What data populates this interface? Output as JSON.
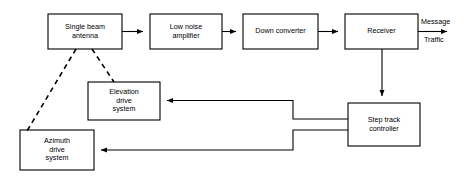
{
  "diagram": {
    "background_color": "#ffffff",
    "line_color": "#000000",
    "blocks": [
      {
        "id": "single-beam-antenna",
        "label": "Single beam\nantenna",
        "x": 48,
        "y": 14,
        "w": 74,
        "h": 35
      },
      {
        "id": "low-noise-amplifier",
        "label": "Low noise\namplifier",
        "x": 150,
        "y": 14,
        "w": 72,
        "h": 35
      },
      {
        "id": "down-converter",
        "label": "Down converter",
        "x": 243,
        "y": 14,
        "w": 75,
        "h": 35
      },
      {
        "id": "receiver",
        "label": "Receiver",
        "x": 345,
        "y": 14,
        "w": 73,
        "h": 35
      },
      {
        "id": "elevation-drive-system",
        "label": "Elevation\ndrive\nsystem",
        "x": 88,
        "y": 82,
        "w": 72,
        "h": 38
      },
      {
        "id": "azimuth-drive-system",
        "label": "Azimuth\ndrive\nsystem",
        "x": 20,
        "y": 130,
        "w": 74,
        "h": 40
      },
      {
        "id": "step-track-controller",
        "label": "Step track\ncontroller",
        "x": 348,
        "y": 103,
        "w": 72,
        "h": 43
      }
    ],
    "edge_labels": [
      {
        "id": "message-label",
        "text": "Message",
        "x": 421,
        "y": 18
      },
      {
        "id": "traffic-label",
        "text": "Traffic",
        "x": 424,
        "y": 36
      }
    ]
  }
}
